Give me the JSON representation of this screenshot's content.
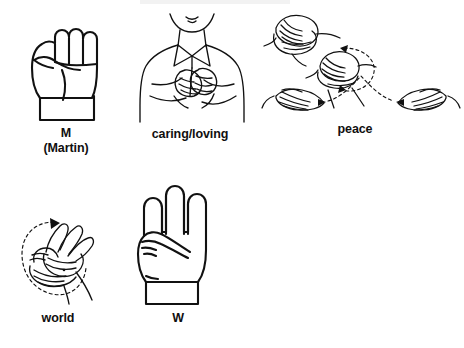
{
  "page": {
    "kind": "asl-sign-worksheet",
    "background_color": "#ffffff",
    "ink_color": "#111111",
    "width": 464,
    "height": 348
  },
  "figures": [
    {
      "id": "m-martin",
      "caption": "M\n(Martin)",
      "caption_lines": [
        "M",
        "(Martin)"
      ],
      "icon": "asl-handshape-m-fist-illustration",
      "description": "Closed fist, palm forward, thumb tucked under three fingers",
      "row": 1,
      "column": 1
    },
    {
      "id": "caring-loving",
      "caption": "caring/loving",
      "caption_lines": [
        "caring/loving"
      ],
      "icon": "asl-sign-caring-loving-illustration",
      "description": "Person in collared shirt with both fists crossed over the chest",
      "row": 1,
      "column": 2
    },
    {
      "id": "peace",
      "caption": "peace",
      "caption_lines": [
        "peace"
      ],
      "icon": "asl-sign-peace-sequence-illustration",
      "description": "Four-panel sequence: clasped hands, clasped hands rotating with dashed circular arrow, then two flat hands moving apart along a dashed arc",
      "row": 1,
      "column": 3,
      "panels": 4,
      "motion": "rotate-then-separate"
    },
    {
      "id": "world",
      "caption": "world",
      "caption_lines": [
        "world"
      ],
      "icon": "asl-sign-world-illustration",
      "description": "Two W handshapes, one circling over the other, shown with a dashed elliptical motion arrow",
      "row": 2,
      "column": 1,
      "motion": "circular"
    },
    {
      "id": "w-handshape",
      "caption": "W",
      "caption_lines": [
        "W"
      ],
      "icon": "asl-handshape-w-illustration",
      "description": "Hand with index, middle and ring fingers extended, thumb holding the little finger",
      "row": 2,
      "column": 2
    }
  ]
}
